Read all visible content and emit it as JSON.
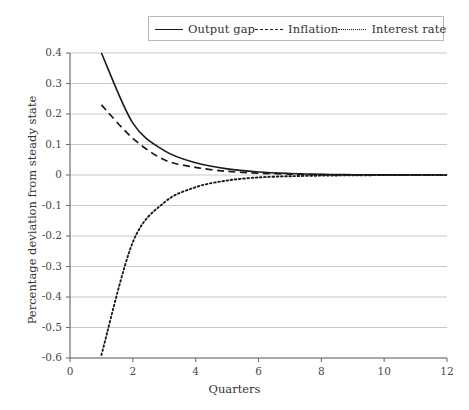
{
  "legend": {
    "position": "top-center",
    "entries": [
      {
        "label": "Output gap",
        "style": "solid",
        "color": "#1a1a1a"
      },
      {
        "label": "Inflation",
        "style": "dashed",
        "color": "#1a1a1a"
      },
      {
        "label": "Interest rate",
        "style": "dotted",
        "color": "#1a1a1a"
      }
    ]
  },
  "axes": {
    "x_title": "Quarters",
    "y_title": "Percentage deviation from steady state",
    "x_ticks": [
      "0",
      "2",
      "4",
      "6",
      "8",
      "10",
      "12"
    ],
    "y_ticks": [
      "0.4",
      "0.3",
      "0.2",
      "0.1",
      "0",
      "-0.1",
      "-0.2",
      "-0.3",
      "-0.4",
      "-0.5",
      "-0.6"
    ]
  },
  "chart_data": {
    "type": "line",
    "title": "",
    "xlabel": "Quarters",
    "ylabel": "Percentage deviation from steady state",
    "xlim": [
      0,
      12
    ],
    "ylim": [
      -0.6,
      0.4
    ],
    "xticks": [
      0,
      2,
      4,
      6,
      8,
      10,
      12
    ],
    "yticks": [
      0.4,
      0.3,
      0.2,
      0.1,
      0,
      -0.1,
      -0.2,
      -0.3,
      -0.4,
      -0.5,
      -0.6
    ],
    "grid": "horizontal",
    "legend_position": "top-center",
    "x": [
      1,
      2,
      3,
      4,
      5,
      6,
      7,
      8,
      9,
      10,
      11,
      12
    ],
    "series": [
      {
        "name": "Output gap",
        "style": "solid",
        "color": "#1a1a1a",
        "values": [
          0.4,
          0.17,
          0.08,
          0.04,
          0.02,
          0.01,
          0.005,
          0.002,
          0.001,
          0.0005,
          0.0002,
          0.0
        ]
      },
      {
        "name": "Inflation",
        "style": "dashed",
        "color": "#1a1a1a",
        "values": [
          0.23,
          0.12,
          0.05,
          0.025,
          0.012,
          0.006,
          0.003,
          0.001,
          0.0005,
          0.0002,
          0.0001,
          0.0
        ]
      },
      {
        "name": "Interest rate",
        "style": "dotted",
        "color": "#1a1a1a",
        "values": [
          -0.59,
          -0.22,
          -0.09,
          -0.04,
          -0.018,
          -0.008,
          -0.004,
          -0.002,
          -0.001,
          -0.0004,
          -0.0002,
          0.0
        ]
      }
    ]
  },
  "plot_geometry": {
    "left": 70,
    "right": 447,
    "top": 53,
    "bottom": 358
  },
  "colors": {
    "line": "#1a1a1a",
    "grid": "#c8c8c8",
    "axis": "#6e6e6e",
    "text": "#333333",
    "background": "#ffffff"
  }
}
